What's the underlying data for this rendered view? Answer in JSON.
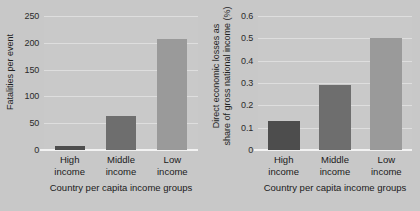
{
  "chart_data": [
    {
      "type": "bar",
      "panel": "left",
      "title": "",
      "xlabel": "Country per capita income groups",
      "ylabel": "Fatalities per event",
      "categories": [
        "High income",
        "Middle income",
        "Low income"
      ],
      "category_lines": [
        [
          "High",
          "income"
        ],
        [
          "Middle",
          "income"
        ],
        [
          "Low",
          "income"
        ]
      ],
      "values": [
        7,
        63,
        207
      ],
      "ylim": [
        0,
        250
      ],
      "yticks": [
        0,
        50,
        100,
        150,
        200,
        250
      ],
      "ytick_labels": [
        "0",
        "50",
        "100",
        "150",
        "200",
        "250"
      ],
      "grid": true,
      "legend": "none",
      "bar_colors": [
        "#4d4d4d",
        "#6e6e6e",
        "#9a9a9a"
      ]
    },
    {
      "type": "bar",
      "panel": "right",
      "title": "",
      "xlabel": "Country per capita income groups",
      "ylabel": "Direct economic losses as share of gross national income (%)",
      "ylabel_lines": [
        "Direct economic losses as",
        "share of gross national income (%)"
      ],
      "categories": [
        "High income",
        "Middle income",
        "Low income"
      ],
      "category_lines": [
        [
          "High",
          "income"
        ],
        [
          "Middle",
          "income"
        ],
        [
          "Low",
          "income"
        ]
      ],
      "values": [
        0.13,
        0.29,
        0.5
      ],
      "ylim": [
        0,
        0.6
      ],
      "yticks": [
        0,
        0.1,
        0.2,
        0.3,
        0.4,
        0.5,
        0.6
      ],
      "ytick_labels": [
        "0",
        "0.1",
        "0.2",
        "0.3",
        "0.4",
        "0.5",
        "0.6"
      ],
      "grid": true,
      "legend": "none",
      "bar_colors": [
        "#4d4d4d",
        "#6e6e6e",
        "#9a9a9a"
      ]
    }
  ],
  "colors": {
    "background": "#c8c8c8",
    "plot_background": "#c9c9c9",
    "gridline": "#dedede",
    "axis": "#f2f2f2",
    "text": "#1a1a1a"
  }
}
